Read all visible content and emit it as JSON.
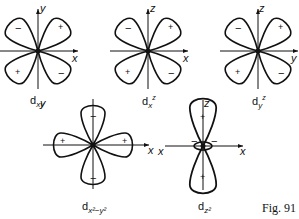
{
  "figure": {
    "caption": "Fig. 91",
    "panels": [
      {
        "id": "dxy",
        "label_main": "d",
        "label_sub": "xy",
        "label_sup": "",
        "h_axis": "x",
        "v_axis": "y",
        "signs": {
          "upper_left": "−",
          "upper_right": "+",
          "lower_left": "+",
          "lower_right": "−"
        }
      },
      {
        "id": "dxz",
        "label_main": "d",
        "label_sub": "x",
        "label_sup": "z",
        "h_axis": "x",
        "v_axis": "z",
        "signs": {
          "upper_left": "−",
          "upper_right": "+",
          "lower_left": "+",
          "lower_right": "−"
        }
      },
      {
        "id": "dyz",
        "label_main": "d",
        "label_sub": "y",
        "label_sup": "z",
        "h_axis": "y",
        "v_axis": "z",
        "signs": {
          "upper_left": "−",
          "upper_right": "+",
          "lower_left": "+",
          "lower_right": "−"
        }
      },
      {
        "id": "dx2-y2",
        "label_main": "d",
        "label_sub": "x²−y²",
        "label_sup": "",
        "h_axis": "x",
        "v_axis": "y",
        "signs": {
          "left": "+",
          "right": "+",
          "top": "−",
          "bottom": "−"
        }
      },
      {
        "id": "dz2",
        "label_main": "d",
        "label_sub": "z²",
        "label_sup": "",
        "h_axis": "x",
        "v_axis": "z",
        "signs": {
          "top": "+",
          "bottom": "+",
          "ring_left": "−",
          "ring_right": "−"
        }
      }
    ]
  }
}
